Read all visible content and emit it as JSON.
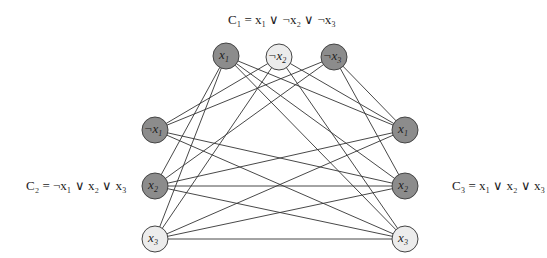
{
  "colors": {
    "dark_node": "#8c8c8c",
    "light_node": "#ececec",
    "edge": "#333333",
    "stroke": "#444444"
  },
  "clauses": [
    {
      "id": "C1",
      "text": "C₁ = x₁ ∨ ¬x₂ ∨ ¬x₃"
    },
    {
      "id": "C2",
      "text": "C₂ = ¬x₁ ∨ x₂ ∨ x₃"
    },
    {
      "id": "C3",
      "text": "C₃ = x₁ ∨ x₂ ∨ x₃"
    }
  ],
  "nodes": [
    {
      "id": "a1",
      "label": "x",
      "sub": "1",
      "neg": false,
      "x": 226,
      "y": 56,
      "dark": true
    },
    {
      "id": "a2",
      "label": "¬x",
      "sub": "2",
      "neg": true,
      "x": 279,
      "y": 57,
      "dark": false
    },
    {
      "id": "a3",
      "label": "¬x",
      "sub": "3",
      "neg": true,
      "x": 334,
      "y": 57,
      "dark": true
    },
    {
      "id": "b1",
      "label": "¬x",
      "sub": "1",
      "neg": true,
      "x": 155,
      "y": 130,
      "dark": true
    },
    {
      "id": "b2",
      "label": "x",
      "sub": "2",
      "neg": false,
      "x": 155,
      "y": 186,
      "dark": true
    },
    {
      "id": "b3",
      "label": "x",
      "sub": "3",
      "neg": false,
      "x": 155,
      "y": 239,
      "dark": false
    },
    {
      "id": "c1",
      "label": "x",
      "sub": "1",
      "neg": false,
      "x": 405,
      "y": 130,
      "dark": true
    },
    {
      "id": "c2",
      "label": "x",
      "sub": "2",
      "neg": false,
      "x": 405,
      "y": 186,
      "dark": true
    },
    {
      "id": "c3",
      "label": "x",
      "sub": "3",
      "neg": false,
      "x": 405,
      "y": 239,
      "dark": false
    }
  ],
  "edges": [
    [
      "a1",
      "b2"
    ],
    [
      "a1",
      "b3"
    ],
    [
      "a2",
      "b1"
    ],
    [
      "a2",
      "b3"
    ],
    [
      "a3",
      "b1"
    ],
    [
      "a3",
      "b2"
    ],
    [
      "a1",
      "c1"
    ],
    [
      "a1",
      "c2"
    ],
    [
      "a1",
      "c3"
    ],
    [
      "a2",
      "c1"
    ],
    [
      "a2",
      "c3"
    ],
    [
      "a3",
      "c1"
    ],
    [
      "a3",
      "c2"
    ],
    [
      "b1",
      "c2"
    ],
    [
      "b1",
      "c3"
    ],
    [
      "b2",
      "c1"
    ],
    [
      "b2",
      "c2"
    ],
    [
      "b2",
      "c3"
    ],
    [
      "b3",
      "c1"
    ],
    [
      "b3",
      "c2"
    ],
    [
      "b3",
      "c3"
    ]
  ]
}
